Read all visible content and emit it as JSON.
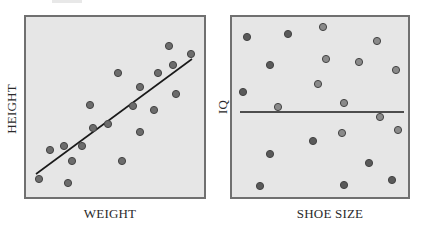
{
  "chart_data": [
    {
      "type": "scatter",
      "title": "",
      "xlabel": "WEIGHT",
      "ylabel": "HEIGHT",
      "grid": false,
      "legend": null,
      "trend_line": "positive linear regression",
      "frame": {
        "x": 25,
        "y": 16,
        "w": 180,
        "h": 182
      },
      "points_px": [
        [
          39,
          179
        ],
        [
          68,
          183
        ],
        [
          50,
          150
        ],
        [
          64,
          146
        ],
        [
          72,
          161
        ],
        [
          82,
          146
        ],
        [
          90,
          105
        ],
        [
          93,
          128
        ],
        [
          108,
          124
        ],
        [
          118,
          73
        ],
        [
          122,
          161
        ],
        [
          133,
          106
        ],
        [
          140,
          87
        ],
        [
          140,
          132
        ],
        [
          154,
          110
        ],
        [
          158,
          73
        ],
        [
          169,
          46
        ],
        [
          173,
          65
        ],
        [
          176,
          94
        ],
        [
          191,
          54
        ]
      ],
      "line_px": [
        [
          36,
          174
        ],
        [
          192,
          59
        ]
      ]
    },
    {
      "type": "scatter",
      "title": "",
      "xlabel": "SHOE SIZE",
      "ylabel": "IQ",
      "grid": false,
      "legend": null,
      "trend_line": "flat (no correlation)",
      "frame": {
        "x": 231,
        "y": 16,
        "w": 178,
        "h": 182
      },
      "points_px": [
        [
          247,
          37,
          "d"
        ],
        [
          288,
          34,
          "d"
        ],
        [
          323,
          27,
          "l"
        ],
        [
          377,
          41,
          "l"
        ],
        [
          270,
          65,
          "d"
        ],
        [
          326,
          59,
          "l"
        ],
        [
          359,
          62,
          "l"
        ],
        [
          396,
          70,
          "l"
        ],
        [
          318,
          84,
          "l"
        ],
        [
          243,
          92,
          "d"
        ],
        [
          278,
          107,
          "l"
        ],
        [
          344,
          103,
          "l"
        ],
        [
          380,
          117,
          "l"
        ],
        [
          398,
          130,
          "l"
        ],
        [
          342,
          133,
          "l"
        ],
        [
          313,
          141,
          "d"
        ],
        [
          270,
          154,
          "d"
        ],
        [
          369,
          163,
          "d"
        ],
        [
          260,
          186,
          "d"
        ],
        [
          344,
          185,
          "d"
        ],
        [
          392,
          180,
          "d"
        ]
      ],
      "line_px": [
        [
          240,
          112
        ],
        [
          404,
          112
        ]
      ]
    }
  ],
  "labels": {
    "left_x": "WEIGHT",
    "left_y": "HEIGHT",
    "right_x": "SHOE SIZE",
    "right_y": "IQ"
  },
  "colors": {
    "plot_bg": "#e6e6e6",
    "frame": "#707070",
    "point_dark": "#5a5a5a",
    "point_light": "#8a8a8a",
    "point_stroke": "#444444",
    "line": "#1a1a1a"
  }
}
